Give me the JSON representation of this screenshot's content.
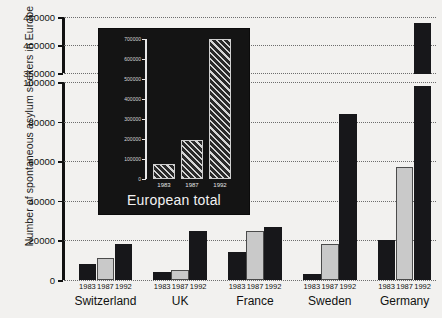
{
  "chart_data": {
    "type": "bar",
    "title": "",
    "xlabel": "",
    "ylabel": "Number of spontaneous asylum seekers in Europe",
    "categories": [
      "Switzerland",
      "UK",
      "France",
      "Sweden",
      "Germany"
    ],
    "series_names": [
      "1983",
      "1987",
      "1992"
    ],
    "series": [
      {
        "name": "1983",
        "values": [
          8000,
          4000,
          14000,
          3000,
          20000
        ]
      },
      {
        "name": "1987",
        "values": [
          11000,
          5000,
          25000,
          18000,
          57000
        ]
      },
      {
        "name": "1992",
        "values": [
          18000,
          25000,
          27000,
          84000,
          440000
        ]
      }
    ],
    "ytick_labels": [
      "0",
      "20000",
      "40000",
      "60000",
      "80000",
      "100000",
      "350000",
      "400000",
      "450000"
    ],
    "ytick_values": [
      0,
      20000,
      40000,
      60000,
      80000,
      100000,
      350000,
      400000,
      450000
    ],
    "ylim": [
      0,
      450000
    ],
    "axis_break": {
      "present": true,
      "lower": 100000,
      "upper": 350000
    },
    "grid": "dotted-horizontal",
    "legend_position": "none",
    "bar_colors": {
      "1983": "#17171a",
      "1987": "#c9c9c9",
      "1992": "#17171a"
    },
    "broken_bar_note": "Germany 1992 bar is drawn across the axis break",
    "background": "#f2f1ef"
  },
  "inset_chart_data": {
    "type": "bar",
    "title": "European total",
    "categories": [
      "1983",
      "1987",
      "1992"
    ],
    "values": [
      75000,
      195000,
      700000
    ],
    "ylim": [
      0,
      700000
    ],
    "ytick_labels": [
      "0",
      "100000",
      "200000",
      "300000",
      "400000",
      "500000",
      "600000",
      "700000"
    ],
    "ytick_values": [
      0,
      100000,
      200000,
      300000,
      400000,
      500000,
      600000,
      700000
    ],
    "xlabel": "",
    "ylabel": "",
    "grid": "off",
    "legend_position": "none",
    "bar_style": "hatched-diagonal",
    "background": "#141414",
    "foreground": "#f2f2f2"
  }
}
